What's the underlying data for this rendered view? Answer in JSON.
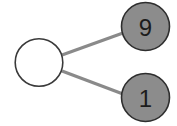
{
  "diagram": {
    "type": "number-bond",
    "whole": {
      "value": "",
      "fill": "#ffffff",
      "stroke": "#3a3a3a"
    },
    "parts": [
      {
        "value": "9",
        "fill": "#8c8c8c",
        "stroke": "#2e2e2e"
      },
      {
        "value": "1",
        "fill": "#8c8c8c",
        "stroke": "#2e2e2e"
      }
    ],
    "connector_color": "#8a8a8a"
  }
}
